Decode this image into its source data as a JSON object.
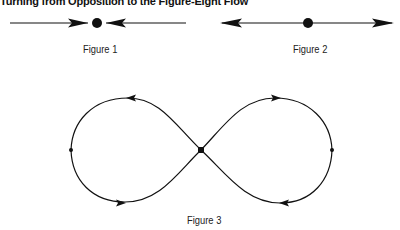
{
  "title": "Turning from Opposition to the Figure-Eight Flow",
  "figures": [
    {
      "id": "figure-1",
      "caption": "Figure 1",
      "description": "Two arrows pointing inward toward a central dot"
    },
    {
      "id": "figure-2",
      "caption": "Figure 2",
      "description": "Two arrows pointing outward away from a central dot"
    },
    {
      "id": "figure-3",
      "caption": "Figure 3",
      "description": "Figure-eight loop with central crossing point and directional arrows"
    }
  ],
  "colors": {
    "stroke": "#111111",
    "background": "#ffffff"
  }
}
